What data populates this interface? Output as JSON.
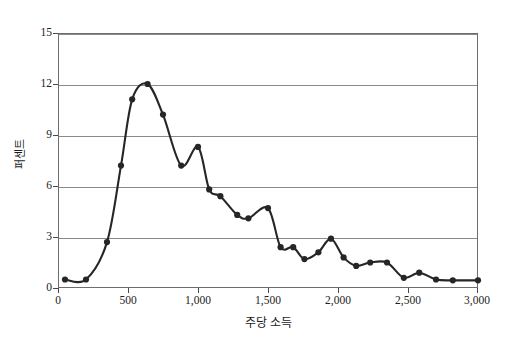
{
  "chart_data": {
    "type": "line",
    "title": "",
    "xlabel": "주당 소득",
    "ylabel": "퍼센트",
    "xlim": [
      0,
      3000
    ],
    "ylim": [
      0,
      15
    ],
    "grid": true,
    "legend": null,
    "marker": "filled-circle",
    "line_color": "#262626",
    "marker_color": "#262626",
    "xticks": [
      0,
      500,
      1000,
      1500,
      2000,
      2500,
      3000
    ],
    "xtick_labels": [
      "0",
      "500",
      "1,000",
      "1,500",
      "2,000",
      "2,500",
      "3,000"
    ],
    "yticks": [
      0,
      3,
      6,
      9,
      12,
      15
    ],
    "ytick_labels": [
      "0",
      "3",
      "6",
      "9",
      "12",
      "15"
    ],
    "x": [
      50,
      200,
      350,
      450,
      530,
      600,
      650,
      750,
      850,
      920,
      1000,
      1070,
      1150,
      1250,
      1320,
      1400,
      1500,
      1570,
      1650,
      1720,
      1800,
      1880,
      1950,
      2030,
      2120,
      2200,
      2280,
      2350,
      2430,
      2520,
      2620,
      2720,
      2800,
      3000
    ],
    "y": [
      0.5,
      0.5,
      2.7,
      7.2,
      11.1,
      12.0,
      12.0,
      10.2,
      7.2,
      8.3,
      8.3,
      5.8,
      5.4,
      4.3,
      4.1,
      4.7,
      4.7,
      2.4,
      2.4,
      1.7,
      2.1,
      2.4,
      2.9,
      1.8,
      1.3,
      1.2,
      1.5,
      1.5,
      1.5,
      0.6,
      0.9,
      0.5,
      0.45,
      0.45
    ],
    "points": [
      {
        "x": 50,
        "y": 0.5
      },
      {
        "x": 200,
        "y": 0.5
      },
      {
        "x": 350,
        "y": 2.7
      },
      {
        "x": 450,
        "y": 7.2
      },
      {
        "x": 530,
        "y": 11.1
      },
      {
        "x": 640,
        "y": 12.0
      },
      {
        "x": 750,
        "y": 10.2
      },
      {
        "x": 880,
        "y": 7.2
      },
      {
        "x": 1000,
        "y": 8.3
      },
      {
        "x": 1080,
        "y": 5.8
      },
      {
        "x": 1160,
        "y": 5.4
      },
      {
        "x": 1280,
        "y": 4.3
      },
      {
        "x": 1360,
        "y": 4.1
      },
      {
        "x": 1500,
        "y": 4.7
      },
      {
        "x": 1590,
        "y": 2.4
      },
      {
        "x": 1680,
        "y": 2.4
      },
      {
        "x": 1760,
        "y": 1.7
      },
      {
        "x": 1860,
        "y": 2.1
      },
      {
        "x": 1950,
        "y": 2.9
      },
      {
        "x": 2040,
        "y": 1.8
      },
      {
        "x": 2130,
        "y": 1.3
      },
      {
        "x": 2230,
        "y": 1.5
      },
      {
        "x": 2350,
        "y": 1.5
      },
      {
        "x": 2470,
        "y": 0.6
      },
      {
        "x": 2580,
        "y": 0.9
      },
      {
        "x": 2700,
        "y": 0.5
      },
      {
        "x": 2820,
        "y": 0.45
      },
      {
        "x": 3000,
        "y": 0.45
      }
    ]
  }
}
